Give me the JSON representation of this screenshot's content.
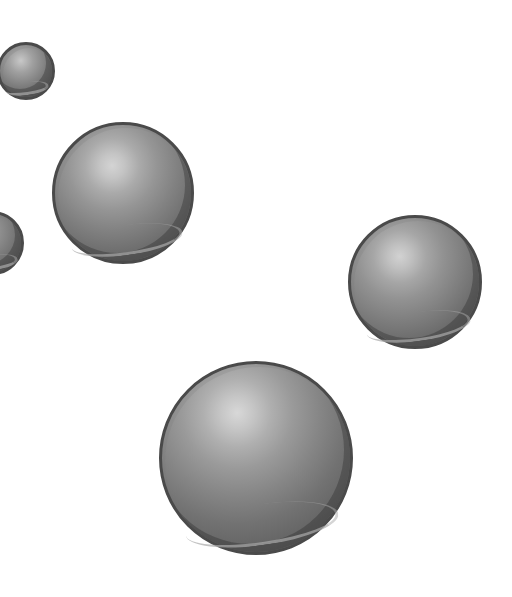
{
  "scene": {
    "description": "Gray shaded spheres on white background",
    "background": "#ffffff",
    "spheres": [
      {
        "id": "small-top-left",
        "cx": 26,
        "cy": 71,
        "r": 29
      },
      {
        "id": "medium-left",
        "cx": 123,
        "cy": 193,
        "r": 71
      },
      {
        "id": "partial-left-edge",
        "cx": -8,
        "cy": 243,
        "r": 32
      },
      {
        "id": "medium-right",
        "cx": 415,
        "cy": 282,
        "r": 67
      },
      {
        "id": "large-bottom",
        "cx": 256,
        "cy": 458,
        "r": 97
      }
    ],
    "colors": {
      "outline": "#4a4a4a",
      "highlight": "#d0d0d0",
      "mid": "#8a8a8a",
      "shadow": "#5a5a5a"
    }
  }
}
